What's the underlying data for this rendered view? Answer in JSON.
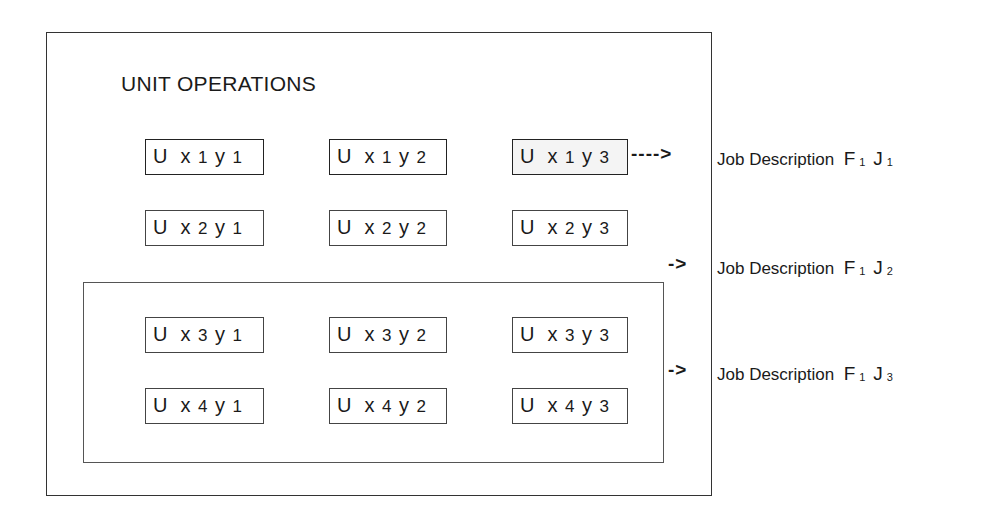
{
  "diagram": {
    "title": "UNIT OPERATIONS",
    "units": [
      {
        "id": "x1y1",
        "label_u": "U",
        "x": "x",
        "xi": "1",
        "y": "y",
        "yi": "1"
      },
      {
        "id": "x1y2",
        "label_u": "U",
        "x": "x",
        "xi": "1",
        "y": "y",
        "yi": "2"
      },
      {
        "id": "x1y3",
        "label_u": "U",
        "x": "x",
        "xi": "1",
        "y": "y",
        "yi": "3"
      },
      {
        "id": "x2y1",
        "label_u": "U",
        "x": "x",
        "xi": "2",
        "y": "y",
        "yi": "1"
      },
      {
        "id": "x2y2",
        "label_u": "U",
        "x": "x",
        "xi": "2",
        "y": "y",
        "yi": "2"
      },
      {
        "id": "x2y3",
        "label_u": "U",
        "x": "x",
        "xi": "2",
        "y": "y",
        "yi": "3"
      },
      {
        "id": "x3y1",
        "label_u": "U",
        "x": "x",
        "xi": "3",
        "y": "y",
        "yi": "1"
      },
      {
        "id": "x3y2",
        "label_u": "U",
        "x": "x",
        "xi": "3",
        "y": "y",
        "yi": "2"
      },
      {
        "id": "x3y3",
        "label_u": "U",
        "x": "x",
        "xi": "3",
        "y": "y",
        "yi": "3"
      },
      {
        "id": "x4y1",
        "label_u": "U",
        "x": "x",
        "xi": "4",
        "y": "y",
        "yi": "1"
      },
      {
        "id": "x4y2",
        "label_u": "U",
        "x": "x",
        "xi": "4",
        "y": "y",
        "yi": "2"
      },
      {
        "id": "x4y3",
        "label_u": "U",
        "x": "x",
        "xi": "4",
        "y": "y",
        "yi": "3"
      }
    ],
    "arrows": [
      {
        "text": "---->"
      },
      {
        "text": "->"
      },
      {
        "text": "->"
      }
    ],
    "jobs": [
      {
        "text": "Job Description",
        "f": "F",
        "f_sub": "1",
        "j": "J",
        "j_sub": "1"
      },
      {
        "text": "Job Description",
        "f": "F",
        "f_sub": "1",
        "j": "J",
        "j_sub": "2"
      },
      {
        "text": "Job Description",
        "f": "F",
        "f_sub": "1",
        "j": "J",
        "j_sub": "3"
      }
    ]
  }
}
